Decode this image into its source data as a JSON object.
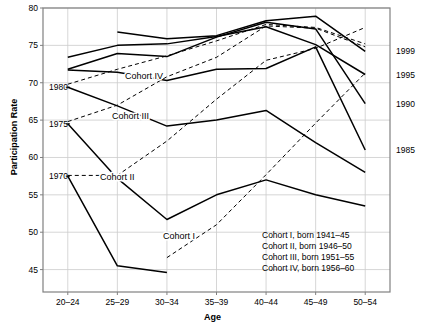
{
  "chart_data": {
    "type": "line",
    "title": "",
    "xlabel": "Age",
    "ylabel": "Participation Rate",
    "categories": [
      "20–24",
      "25–29",
      "30–34",
      "35–39",
      "40–44",
      "45–49",
      "50–54"
    ],
    "ylim": [
      42,
      80
    ],
    "yticks": [
      45,
      50,
      55,
      60,
      65,
      70,
      75,
      80
    ],
    "grid": true,
    "legend_position": "inside-bottom-right",
    "series": [
      {
        "name": "1970",
        "style": "solid",
        "label_side": "left",
        "values": [
          57.5,
          45.5,
          44.6,
          null,
          null,
          null,
          null
        ]
      },
      {
        "name": "1975",
        "style": "solid",
        "label_side": "left",
        "values": [
          64.5,
          57.2,
          51.7,
          55.0,
          57.0,
          55.0,
          53.5
        ]
      },
      {
        "name": "1980",
        "style": "solid",
        "label_side": "left",
        "values": [
          69.4,
          66.9,
          64.2,
          65.0,
          66.3,
          62.0,
          58.0
        ]
      },
      {
        "name": "1985",
        "style": "solid",
        "label_side": "right",
        "values": [
          71.7,
          71.4,
          70.3,
          71.8,
          71.9,
          74.8,
          61.0
        ]
      },
      {
        "name": "1990",
        "style": "solid",
        "label_side": "right",
        "values": [
          71.8,
          73.9,
          73.5,
          76.1,
          78.1,
          77.2,
          67.2
        ]
      },
      {
        "name": "1995",
        "style": "solid",
        "label_side": "right",
        "values": [
          73.4,
          75.0,
          75.2,
          76.2,
          77.5,
          75.1,
          71.1
        ]
      },
      {
        "name": "1999",
        "style": "solid",
        "label_side": "right",
        "values": [
          null,
          76.8,
          75.9,
          76.3,
          78.3,
          78.9,
          74.2
        ]
      }
    ],
    "cohorts": [
      {
        "name": "Cohort I",
        "style": "dashed",
        "born": "1941–45",
        "points": [
          [
            2,
            46.6
          ],
          [
            3,
            51.0
          ],
          [
            4,
            57.7
          ],
          [
            5,
            64.6
          ],
          [
            6,
            71.3
          ]
        ]
      },
      {
        "name": "Cohort II",
        "style": "dashed",
        "born": "1946–50",
        "points": [
          [
            0,
            57.6
          ],
          [
            1,
            57.6
          ],
          [
            2,
            62.2
          ],
          [
            3,
            67.8
          ],
          [
            4,
            73.0
          ],
          [
            5,
            74.6
          ],
          [
            6,
            77.4
          ]
        ]
      },
      {
        "name": "Cohort III",
        "style": "dashed",
        "born": "1951–55",
        "points": [
          [
            0,
            64.8
          ],
          [
            1,
            67.0
          ],
          [
            2,
            70.8
          ],
          [
            3,
            73.4
          ],
          [
            4,
            77.6
          ],
          [
            5,
            77.3
          ],
          [
            6,
            74.8
          ]
        ]
      },
      {
        "name": "Cohort IV",
        "style": "dashed",
        "born": "1956–60",
        "points": [
          [
            0,
            69.8
          ],
          [
            1,
            71.8
          ],
          [
            2,
            73.6
          ],
          [
            3,
            75.6
          ],
          [
            4,
            77.8
          ],
          [
            5,
            77.4
          ],
          [
            6,
            75.2
          ]
        ]
      }
    ],
    "left_year_labels": [
      {
        "text": "1980",
        "value": 69.4
      },
      {
        "text": "1975",
        "value": 64.5
      },
      {
        "text": "1970",
        "value": 57.5
      }
    ],
    "right_year_labels": [
      {
        "text": "1999",
        "value": 74.2
      },
      {
        "text": "1995",
        "value": 71.1
      },
      {
        "text": "1990",
        "value": 67.2
      },
      {
        "text": "1985",
        "value": 61.0
      }
    ],
    "inline_cohort_labels": [
      {
        "text": "Cohort IV",
        "x": 125,
        "y": 79
      },
      {
        "text": "Cohort III",
        "x": 112,
        "y": 119
      },
      {
        "text": "Cohort II",
        "x": 100,
        "y": 180
      },
      {
        "text": "Cohort I",
        "x": 163,
        "y": 239
      }
    ],
    "legend_lines": [
      "Cohort I, born 1941–45",
      "Cohort II, born 1946–50",
      "Cohort III, born 1951–55",
      "Cohort IV, born 1956–60"
    ],
    "colors": {
      "line": "#000000",
      "grid": "#cccccc",
      "axis": "#808080",
      "background": "#ffffff"
    }
  }
}
